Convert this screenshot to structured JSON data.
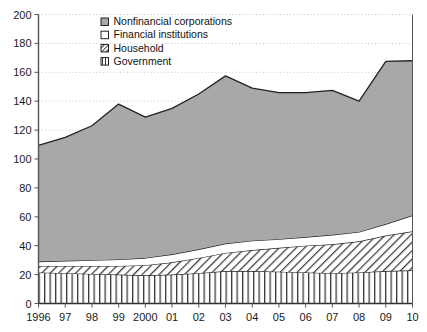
{
  "chart_data": {
    "type": "area",
    "stacked": true,
    "title": "",
    "subtitle": "",
    "xlabel": "",
    "ylabel": "",
    "xlim": [
      1996,
      2010
    ],
    "ylim": [
      0,
      200
    ],
    "ytick_step": 20,
    "grid": true,
    "grid_style": "dotted-horizontal",
    "legend_position": "top-center",
    "x": [
      1996,
      1997,
      1998,
      1999,
      2000,
      2001,
      2002,
      2003,
      2004,
      2005,
      2006,
      2007,
      2008,
      2009,
      2010
    ],
    "xtick_labels": [
      "1996",
      "97",
      "98",
      "99",
      "2000",
      "01",
      "02",
      "03",
      "04",
      "05",
      "06",
      "07",
      "08",
      "09",
      "10"
    ],
    "ytick_labels": [
      "0",
      "20",
      "40",
      "60",
      "80",
      "100",
      "120",
      "140",
      "160",
      "180",
      "200"
    ],
    "series": [
      {
        "name": "Government",
        "pattern": "vertical-stripes",
        "fill": "#ffffff",
        "stroke": "#222222",
        "order": 1,
        "values": [
          21.5,
          21.0,
          20.5,
          20.0,
          19.5,
          20.0,
          21.0,
          22.5,
          22.5,
          22.0,
          21.5,
          21.0,
          21.5,
          22.5,
          23.0
        ]
      },
      {
        "name": "Household",
        "pattern": "diagonal-hatch",
        "fill": "#ffffff",
        "stroke": "#222222",
        "order": 2,
        "values": [
          4.5,
          5.0,
          5.5,
          6.0,
          7.0,
          8.5,
          10.5,
          12.5,
          14.5,
          16.5,
          18.5,
          20.0,
          21.5,
          24.5,
          27.0
        ]
      },
      {
        "name": "Financial institutions",
        "pattern": "solid-white",
        "fill": "#ffffff",
        "stroke": "#222222",
        "order": 3,
        "values": [
          3.0,
          3.5,
          4.0,
          4.5,
          5.0,
          5.5,
          6.0,
          6.5,
          6.5,
          6.0,
          6.0,
          6.5,
          6.5,
          8.0,
          11.0
        ]
      },
      {
        "name": "Nonfinancial corporations",
        "pattern": "solid-gray",
        "fill": "#a8a8a8",
        "stroke": "#222222",
        "order": 4,
        "values": [
          80.5,
          85.5,
          93.0,
          107.5,
          97.5,
          101.0,
          107.5,
          116.0,
          105.5,
          101.5,
          100.0,
          100.0,
          90.5,
          112.5,
          107.0
        ]
      }
    ],
    "cumulative_totals": [
      109.5,
      115.0,
      123.0,
      138.0,
      129.0,
      135.0,
      145.0,
      157.5,
      149.0,
      146.0,
      146.0,
      147.5,
      140.0,
      167.5,
      168.0
    ],
    "legend_entries": [
      {
        "label": "Nonfinancial corporations",
        "swatch": "solid-gray"
      },
      {
        "label": "Financial institutions",
        "swatch": "solid-white"
      },
      {
        "label": "Household",
        "swatch": "diagonal-hatch"
      },
      {
        "label": "Government",
        "swatch": "vertical-stripes"
      }
    ],
    "colors": {
      "nonfinancial": "#a8a8a8",
      "financial": "#ffffff",
      "household": "#ffffff",
      "government": "#ffffff",
      "axis": "#555555",
      "grid": "#bdbdbd",
      "outline": "#222222"
    }
  }
}
